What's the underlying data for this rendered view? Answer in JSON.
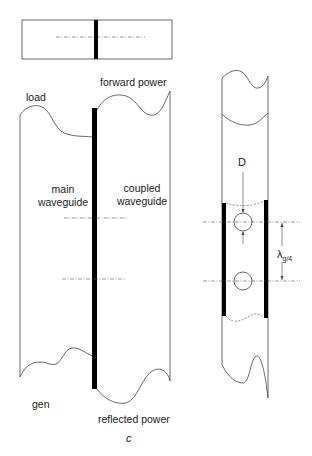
{
  "figure": {
    "caption": "c",
    "colors": {
      "line": "#333333",
      "bar": "#000000",
      "dash": "#555555",
      "background": "#ffffff"
    }
  },
  "top_view": {
    "description": "Top view of coupled waveguides with coupling wall"
  },
  "side_view": {
    "labels": {
      "load": "load",
      "forward_power": "forward power",
      "main_waveguide_line1": "main",
      "main_waveguide_line2": "waveguide",
      "coupled_waveguide_line1": "coupled",
      "coupled_waveguide_line2": "waveguide",
      "gen": "gen",
      "reflected_power": "reflected power"
    }
  },
  "detail_view": {
    "labels": {
      "hole_diameter": "D",
      "spacing_main": "λ",
      "spacing_sub": "g/4"
    }
  }
}
